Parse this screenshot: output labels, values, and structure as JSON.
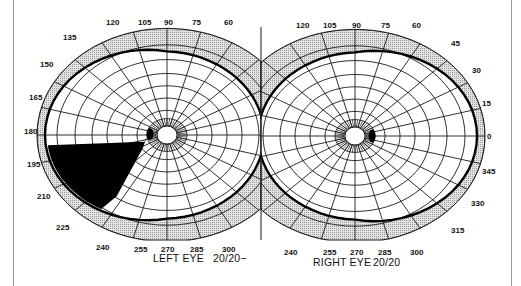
{
  "figure": {
    "colors": {
      "background": "#ffffff",
      "peripheral_band": "#cfcfcf",
      "grid_line": "#1a1a1a",
      "field_boundary": "#000000",
      "scotoma": "#000000",
      "frame": "#9a9a9a"
    },
    "left_eye": {
      "label": "LEFT EYE",
      "acuity": "20/20−",
      "center": [
        167,
        135
      ],
      "angle_labels_top": [
        "135",
        "120",
        "105",
        "90",
        "75",
        "60"
      ],
      "angle_labels_left": [
        "150",
        "165",
        "180",
        "195",
        "210",
        "225"
      ],
      "angle_labels_bottom": [
        "240",
        "255",
        "270",
        "285",
        "300"
      ],
      "defect": "Dense wedge-shaped scotoma in the inferior temporal field, from about 185° to 235°, extending from the blind spot to the periphery",
      "blind_spot_angle": 180
    },
    "right_eye": {
      "label": "RIGHT EYE",
      "acuity": "20/20",
      "center": [
        355,
        136
      ],
      "angle_labels_top": [
        "120",
        "105",
        "90",
        "75",
        "60",
        "45"
      ],
      "angle_labels_right": [
        "30",
        "15",
        "0",
        "345",
        "330",
        "315"
      ],
      "angle_labels_bottom": [
        "240",
        "255",
        "270",
        "285",
        "300"
      ],
      "defect": "Normal field; physiological blind spot only",
      "blind_spot_angle": 0
    }
  }
}
